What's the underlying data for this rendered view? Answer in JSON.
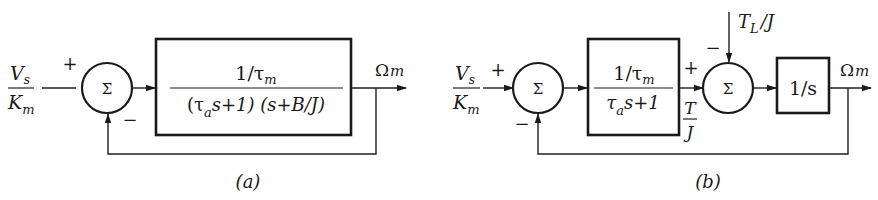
{
  "diagram_a": {
    "caption": "(a)",
    "input": {
      "numerator": "V",
      "numerator_sub": "s",
      "denominator": "K",
      "denominator_sub": "m"
    },
    "sum_symbol": "Σ",
    "sum_signs": {
      "top": "+",
      "bottom": "−"
    },
    "block": {
      "numerator": "1/τ",
      "numerator_sub": "m",
      "denominator_part1": "(τ",
      "denominator_sub": "a",
      "denominator_part2": "s+1) (s+B/J)"
    },
    "output": {
      "label": "Ω",
      "label_sub": "m"
    },
    "feedback": "unity negative feedback"
  },
  "diagram_b": {
    "caption": "(b)",
    "input": {
      "numerator": "V",
      "numerator_sub": "s",
      "denominator": "K",
      "denominator_sub": "m"
    },
    "sum1_symbol": "Σ",
    "sum1_signs": {
      "left": "+",
      "bottom": "−"
    },
    "block1": {
      "numerator": "1/τ",
      "numerator_sub": "m",
      "denominator": "τ",
      "denominator_sub": "a",
      "denominator_rest": "s+1"
    },
    "intermediate_signal": {
      "sign": "+",
      "numerator": "T",
      "denominator": "J"
    },
    "disturbance": {
      "label": "T",
      "label_sub": "L",
      "label_rest": "/J",
      "sign": "−"
    },
    "sum2_symbol": "Σ",
    "block2": {
      "label": "1/s"
    },
    "output": {
      "label": "Ω",
      "label_sub": "m"
    },
    "feedback": "unity negative feedback"
  }
}
